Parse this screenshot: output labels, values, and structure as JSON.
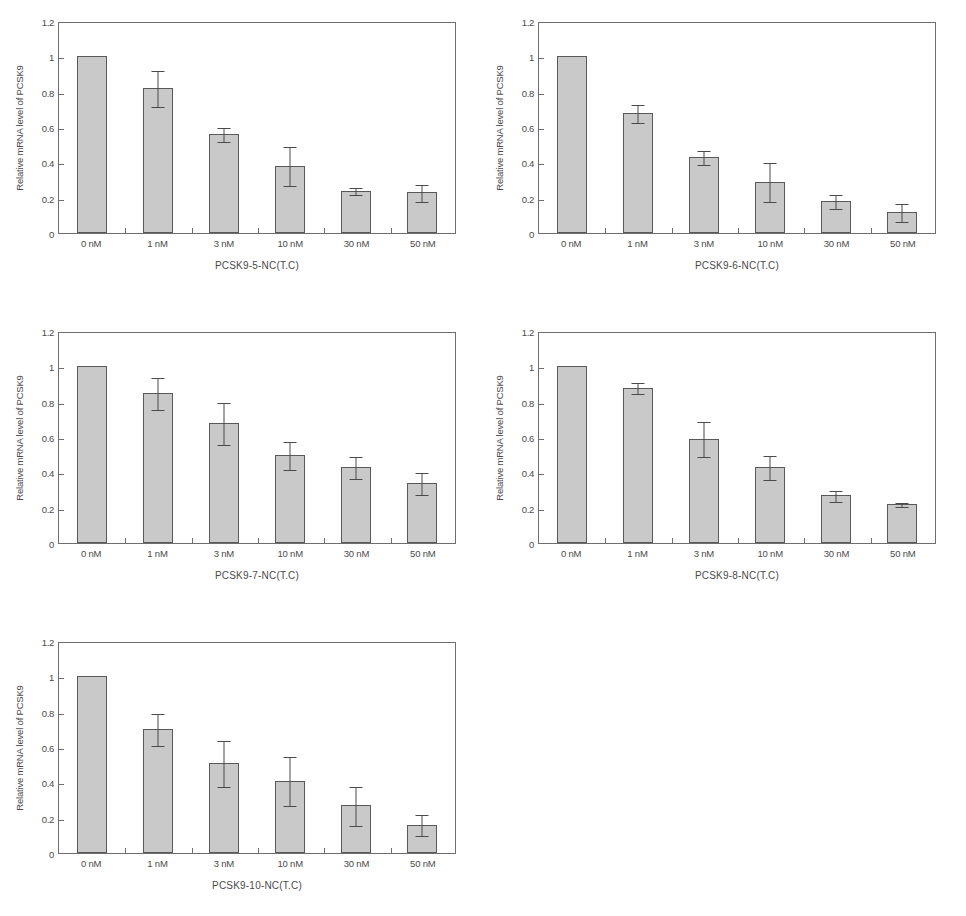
{
  "figure": {
    "axis": {
      "ylabel": "Relative mRNA level of PCSK9",
      "yticks": [
        "0",
        "0.2",
        "0.4",
        "0.6",
        "0.8",
        "1",
        "1.2"
      ],
      "ylim": [
        0,
        1.2
      ],
      "categories": [
        "0 nM",
        "1 nM",
        "3 nM",
        "10 nM",
        "30 nM",
        "50 nM"
      ]
    },
    "colors": {
      "bar_fill": "#c9c9c9",
      "bar_stroke": "#595959",
      "axis": "#6e6e6e",
      "text": "#4a4a4a",
      "background": "#ffffff"
    }
  },
  "chart_data": [
    {
      "type": "bar",
      "title": "PCSK9-5-NC(T.C)",
      "xlabel": "PCSK9-5-NC(T.C)",
      "ylabel": "Relative mRNA level of PCSK9",
      "categories": [
        "0 nM",
        "1 nM",
        "3 nM",
        "10 nM",
        "30 nM",
        "50 nM"
      ],
      "values": [
        1.0,
        0.82,
        0.56,
        0.38,
        0.24,
        0.23
      ],
      "errors": [
        0.0,
        0.1,
        0.04,
        0.11,
        0.02,
        0.05
      ],
      "ylim": [
        0,
        1.2
      ],
      "yticks": [
        0,
        0.2,
        0.4,
        0.6,
        0.8,
        1,
        1.2
      ],
      "grid": false,
      "legend": false
    },
    {
      "type": "bar",
      "title": "PCSK9-6-NC(T.C)",
      "xlabel": "PCSK9-6-NC(T.C)",
      "ylabel": "Relative mRNA level of PCSK9",
      "categories": [
        "0 nM",
        "1 nM",
        "3 nM",
        "10 nM",
        "30 nM",
        "50 nM"
      ],
      "values": [
        1.0,
        0.68,
        0.43,
        0.29,
        0.18,
        0.12
      ],
      "errors": [
        0.0,
        0.05,
        0.04,
        0.11,
        0.04,
        0.05
      ],
      "ylim": [
        0,
        1.2
      ],
      "yticks": [
        0,
        0.2,
        0.4,
        0.6,
        0.8,
        1,
        1.2
      ],
      "grid": false,
      "legend": false
    },
    {
      "type": "bar",
      "title": "PCSK9-7-NC(T.C)",
      "xlabel": "PCSK9-7-NC(T.C)",
      "ylabel": "Relative mRNA level of PCSK9",
      "categories": [
        "0 nM",
        "1 nM",
        "3 nM",
        "10 nM",
        "30 nM",
        "50 nM"
      ],
      "values": [
        1.0,
        0.85,
        0.68,
        0.5,
        0.43,
        0.34
      ],
      "errors": [
        0.0,
        0.09,
        0.12,
        0.08,
        0.06,
        0.06
      ],
      "ylim": [
        0,
        1.2
      ],
      "yticks": [
        0,
        0.2,
        0.4,
        0.6,
        0.8,
        1,
        1.2
      ],
      "grid": false,
      "legend": false
    },
    {
      "type": "bar",
      "title": "PCSK9-8-NC(T.C)",
      "xlabel": "PCSK9-8-NC(T.C)",
      "ylabel": "Relative mRNA level of PCSK9",
      "categories": [
        "0 nM",
        "1 nM",
        "3 nM",
        "10 nM",
        "30 nM",
        "50 nM"
      ],
      "values": [
        1.0,
        0.88,
        0.59,
        0.43,
        0.27,
        0.22
      ],
      "errors": [
        0.0,
        0.03,
        0.1,
        0.07,
        0.03,
        0.01
      ],
      "ylim": [
        0,
        1.2
      ],
      "yticks": [
        0,
        0.2,
        0.4,
        0.6,
        0.8,
        1,
        1.2
      ],
      "grid": false,
      "legend": false
    },
    {
      "type": "bar",
      "title": "PCSK9-10-NC(T.C)",
      "xlabel": "PCSK9-10-NC(T.C)",
      "ylabel": "Relative mRNA level of PCSK9",
      "categories": [
        "0 nM",
        "1 nM",
        "3 nM",
        "10 nM",
        "30 nM",
        "50 nM"
      ],
      "values": [
        1.0,
        0.7,
        0.51,
        0.41,
        0.27,
        0.16
      ],
      "errors": [
        0.0,
        0.09,
        0.13,
        0.14,
        0.11,
        0.06
      ],
      "ylim": [
        0,
        1.2
      ],
      "yticks": [
        0,
        0.2,
        0.4,
        0.6,
        0.8,
        1,
        1.2
      ],
      "grid": false,
      "legend": false
    }
  ]
}
